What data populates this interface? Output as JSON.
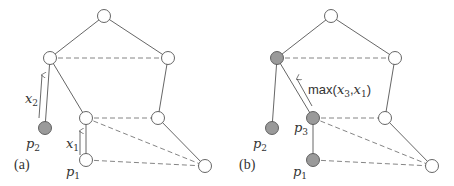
{
  "panels": [
    {
      "label": "(a)",
      "annotations": {
        "x2": {
          "base": "x",
          "sub": "2"
        },
        "x1": {
          "base": "x",
          "sub": "1"
        },
        "p2": {
          "base": "p",
          "sub": "2"
        },
        "p1": {
          "base": "p",
          "sub": "1"
        }
      }
    },
    {
      "label": "(b)",
      "annotations": {
        "max_fn": "max(",
        "x3": {
          "base": "x",
          "sub": "3"
        },
        "comma": ",",
        "x1": {
          "base": "x",
          "sub": "1"
        },
        "close": ")",
        "p3": {
          "base": "p",
          "sub": "3"
        },
        "p2": {
          "base": "p",
          "sub": "2"
        },
        "p1": {
          "base": "p",
          "sub": "1"
        }
      }
    }
  ],
  "colors": {
    "node_open": "#ffffff",
    "node_filled": "#9a9a9a",
    "edge": "#555555"
  }
}
